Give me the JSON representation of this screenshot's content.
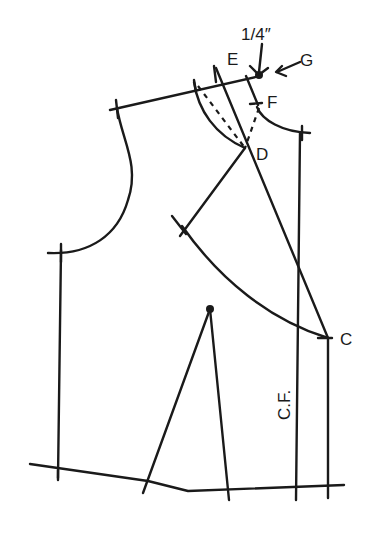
{
  "diagram": {
    "type": "sewing-pattern-bodice-front",
    "labels": {
      "E": "E",
      "F": "F",
      "G": "G",
      "D": "D",
      "C": "C",
      "measurement": "1/4″",
      "center_front": "C.F."
    },
    "colors": {
      "ink": "#1a1a1a",
      "background": "#ffffff"
    }
  }
}
